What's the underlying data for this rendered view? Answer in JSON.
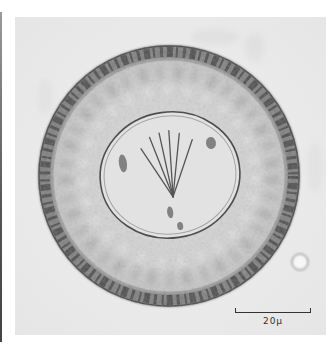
{
  "image": {
    "subject": "micrograph of round egg with thick striated outer shell and inner oncosphere with hooklets",
    "background_color": "#ececec",
    "frame_color": "#ffffff"
  },
  "scale_bar": {
    "label": "20μ"
  },
  "colors": {
    "shell_dark": "#3a3a3a",
    "shell_mid": "#8a8a8a",
    "interior": "#d6d6d6",
    "oncosphere_fill": "#e4e4e4",
    "oncosphere_outline": "#5a5a5a"
  }
}
